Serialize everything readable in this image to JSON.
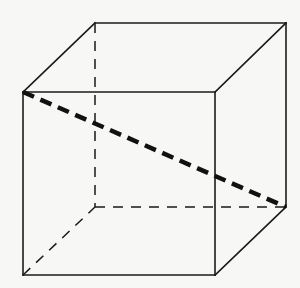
{
  "diagram": {
    "type": "cube",
    "background": "#f7f7f5",
    "stroke_color": "#1a1a1a",
    "vertices": {
      "front_top_left": [
        23,
        92
      ],
      "front_top_right": [
        215,
        92
      ],
      "front_bottom_left": [
        23,
        275
      ],
      "front_bottom_right": [
        215,
        275
      ],
      "back_top_left": [
        95,
        23
      ],
      "back_top_right": [
        286,
        23
      ],
      "back_bottom_left": [
        95,
        207
      ],
      "back_bottom_right": [
        286,
        207
      ]
    },
    "solid_edges": [
      {
        "name": "front-top-edge",
        "from": "front_top_left",
        "to": "front_top_right"
      },
      {
        "name": "front-bottom-edge",
        "from": "front_bottom_left",
        "to": "front_bottom_right"
      },
      {
        "name": "front-left-edge",
        "from": "front_top_left",
        "to": "front_bottom_left"
      },
      {
        "name": "front-right-edge",
        "from": "front_top_right",
        "to": "front_bottom_right"
      },
      {
        "name": "back-top-edge",
        "from": "back_top_left",
        "to": "back_top_right"
      },
      {
        "name": "back-right-edge",
        "from": "back_top_right",
        "to": "back_bottom_right"
      },
      {
        "name": "top-left-connector",
        "from": "front_top_left",
        "to": "back_top_left"
      },
      {
        "name": "top-right-connector",
        "from": "front_top_right",
        "to": "back_top_right"
      },
      {
        "name": "bottom-right-connector",
        "from": "front_bottom_right",
        "to": "back_bottom_right"
      }
    ],
    "hidden_edges": [
      {
        "name": "back-left-edge",
        "from": "back_top_left",
        "to": "back_bottom_left"
      },
      {
        "name": "back-bottom-edge",
        "from": "back_bottom_left",
        "to": "back_bottom_right"
      },
      {
        "name": "bottom-left-connector",
        "from": "front_bottom_left",
        "to": "back_bottom_left"
      }
    ],
    "space_diagonal": {
      "name": "space-diagonal",
      "from": "front_top_left",
      "to": "back_bottom_right",
      "style": "thick-dashed"
    }
  }
}
